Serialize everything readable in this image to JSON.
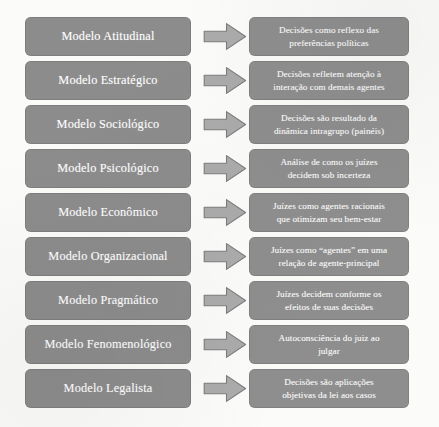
{
  "figure": {
    "kind": "flow-diagram",
    "orientation": "left-to-right",
    "row_count": 9,
    "colors": {
      "box_fill": "#8c8c8c",
      "box_text": "#fdfdfd",
      "arrow_fill": "#ababab",
      "arrow_stroke": "#7c7c7c",
      "page_background": "#fbfbfa"
    }
  },
  "rows": [
    {
      "model": "Modelo Atitudinal",
      "arrow": "right-arrow-icon",
      "description_lines": [
        "Decisões como reflexo das",
        "preferências políticas"
      ],
      "description": "Decisões como reflexo das preferências políticas"
    },
    {
      "model": "Modelo Estratégico",
      "arrow": "right-arrow-icon",
      "description_lines": [
        "Decisões refletem atenção à",
        "interação com demais agentes"
      ],
      "description": "Decisões refletem atenção à interação com demais agentes"
    },
    {
      "model": "Modelo Sociológico",
      "arrow": "right-arrow-icon",
      "description_lines": [
        "Decisões são resultado da",
        "dinâmica intragrupo (painéis)"
      ],
      "description": "Decisões são resultado da dinâmica intragrupo (painéis)"
    },
    {
      "model": "Modelo Psicológico",
      "arrow": "right-arrow-icon",
      "description_lines": [
        "Análise de como os juízes",
        "decidem sob incerteza"
      ],
      "description": "Análise de como os juízes decidem sob incerteza"
    },
    {
      "model": "Modelo Econômico",
      "arrow": "right-arrow-icon",
      "description_lines": [
        "Juízes como agentes racionais",
        "que otimizam seu bem-estar"
      ],
      "description": "Juízes como agentes racionais que otimizam seu bem-estar"
    },
    {
      "model": "Modelo Organizacional",
      "arrow": "right-arrow-icon",
      "description_lines": [
        "Juízes como “agentes” em uma",
        "relação de agente-principal"
      ],
      "description": "Juízes como “agentes” em uma relação de agente-principal"
    },
    {
      "model": "Modelo Pragmático",
      "arrow": "right-arrow-icon",
      "description_lines": [
        "Juízes decidem conforme os",
        "efeitos de suas decisões"
      ],
      "description": "Juízes decidem conforme os efeitos de suas decisões"
    },
    {
      "model": "Modelo Fenomenológico",
      "arrow": "right-arrow-icon",
      "description_lines": [
        "Autoconsciência do juiz ao",
        "julgar"
      ],
      "description": "Autoconsciência do juiz ao julgar"
    },
    {
      "model": "Modelo Legalista",
      "arrow": "right-arrow-icon",
      "description_lines": [
        "Decisões são aplicações",
        "objetivas da lei aos casos"
      ],
      "description": "Decisões são aplicações objetivas da lei aos casos"
    }
  ]
}
